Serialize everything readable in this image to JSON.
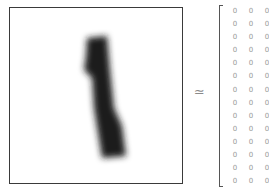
{
  "image": {
    "label": "digit-image",
    "digit": "1",
    "stroke_color": "#1e1e1e",
    "frame_color": "#3a3a3a"
  },
  "relation": {
    "symbol": "≃"
  },
  "matrix": {
    "rows": [
      [
        "0",
        "0",
        "0"
      ],
      [
        "0",
        "0",
        "0"
      ],
      [
        "0",
        "0",
        "0"
      ],
      [
        "0",
        "0",
        "0"
      ],
      [
        "0",
        "0",
        "0"
      ],
      [
        "0",
        "0",
        "0"
      ],
      [
        "0",
        "0",
        "0"
      ],
      [
        "0",
        "0",
        "0"
      ],
      [
        "0",
        "0",
        "0"
      ],
      [
        "0",
        "0",
        "0"
      ],
      [
        "0",
        "0",
        "0"
      ],
      [
        "0",
        "0",
        "0"
      ],
      [
        "0",
        "0",
        "0"
      ],
      [
        "0",
        "0",
        "0"
      ]
    ]
  }
}
